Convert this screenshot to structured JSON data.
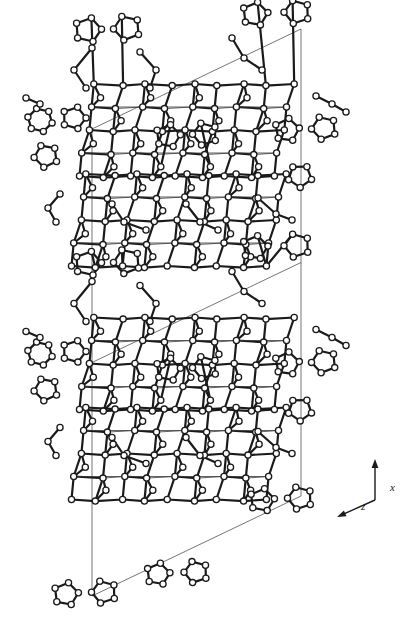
{
  "figure": {
    "kind": "crystal-structure-projection",
    "title": "",
    "background_color": "#ffffff",
    "atom_fill_color": "#ffffff",
    "atom_stroke_color": "#1a1a1a",
    "bond_color": "#1a1a1a",
    "cell_line_color": "#3a3a3a",
    "atom_radius": 3.1,
    "bond_width": 2.2,
    "cell_line_width": 0.7
  },
  "axes": {
    "origin": {
      "x": 375,
      "y": 500
    },
    "vertical": {
      "label": "x",
      "tip": {
        "x": 375,
        "y": 459
      },
      "label_pos": {
        "x": 390,
        "y": 491
      }
    },
    "diagonal": {
      "label": "z",
      "tip": {
        "x": 337,
        "y": 517
      },
      "label_pos": {
        "x": 361,
        "y": 510
      }
    }
  },
  "unit_cell": {
    "left_vertical": {
      "x": 92,
      "y_top": 129,
      "y_bottom": 596
    },
    "right_vertical": {
      "x": 301,
      "y_top": 29,
      "y_bottom": 496
    },
    "top_diagonal": {
      "x1": 92,
      "y1": 129,
      "x2": 301,
      "y2": 29
    },
    "bottom_diagonal": {
      "x1": 92,
      "y1": 596,
      "x2": 301,
      "y2": 496
    },
    "repeat_y": 233.5
  },
  "chart_data": {
    "type": "scatter",
    "xlabel": "z",
    "ylabel": "x",
    "grid": false,
    "legend": null,
    "note": "Open circles are framework T/O atoms; heavy segments are bonds; thin lines outline the unit cell."
  }
}
